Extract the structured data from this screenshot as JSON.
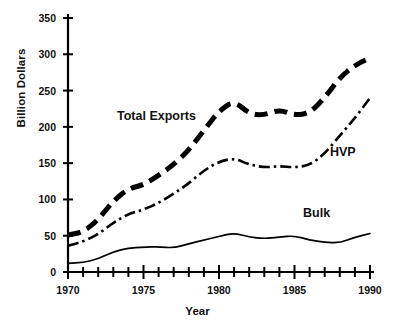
{
  "chart_data": {
    "type": "line",
    "title": "",
    "xlabel": "Year",
    "ylabel": "Billion Dollars",
    "xlim": [
      1970,
      1990
    ],
    "ylim": [
      0,
      350
    ],
    "grid": false,
    "legend_position": "inline-annotations",
    "y_ticks": [
      0,
      50,
      100,
      150,
      200,
      250,
      300,
      350
    ],
    "y_tick_labels": [
      "0",
      "50",
      "100",
      "150",
      "200",
      "250",
      "300",
      "350"
    ],
    "x_ticks": [
      1970,
      1971,
      1972,
      1973,
      1974,
      1975,
      1976,
      1977,
      1978,
      1979,
      1980,
      1981,
      1982,
      1983,
      1984,
      1985,
      1986,
      1987,
      1988,
      1989,
      1990
    ],
    "x_tick_labels_shown": [
      "1970",
      "1975",
      "1980",
      "1985",
      "1990"
    ],
    "x_labeled_ticks": [
      1970,
      1975,
      1980,
      1985,
      1990
    ],
    "x": [
      1970,
      1971,
      1972,
      1973,
      1974,
      1975,
      1976,
      1977,
      1978,
      1979,
      1980,
      1981,
      1982,
      1983,
      1984,
      1985,
      1986,
      1987,
      1988,
      1989,
      1990
    ],
    "series": [
      {
        "name": "Total Exports",
        "style": "thick-dashed",
        "color": "#000000",
        "values": [
          51,
          55,
          72,
          98,
          115,
          120,
          133,
          148,
          168,
          195,
          222,
          236,
          218,
          216,
          224,
          216,
          219,
          240,
          268,
          285,
          295
        ]
      },
      {
        "name": "HVP",
        "style": "dash-dot",
        "color": "#000000",
        "values": [
          36,
          42,
          52,
          68,
          80,
          86,
          95,
          108,
          122,
          140,
          152,
          157,
          148,
          144,
          146,
          144,
          147,
          163,
          188,
          212,
          240
        ]
      },
      {
        "name": "Bulk",
        "style": "solid-thin",
        "color": "#000000",
        "values": [
          12,
          13,
          18,
          28,
          33,
          34,
          35,
          33,
          39,
          44,
          49,
          54,
          48,
          46,
          48,
          50,
          44,
          41,
          40,
          48,
          53
        ]
      }
    ],
    "annotations": [
      {
        "text": "Total Exports",
        "x_px": 117,
        "y_px": 110
      },
      {
        "text": "HVP",
        "x_px": 330,
        "y_px": 146
      },
      {
        "text": "Bulk",
        "x_px": 303,
        "y_px": 207
      }
    ]
  }
}
